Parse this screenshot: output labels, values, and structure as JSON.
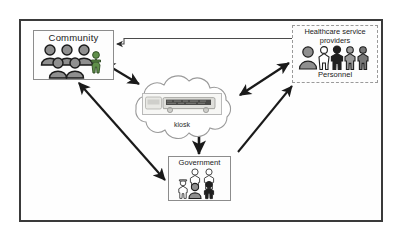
{
  "diagram": {
    "frame_label": "diagram-frame",
    "colors": {
      "frame_border": "#3a3a3a",
      "box_border": "#8c8c8c",
      "dashed_border": "#9a9a9a",
      "arrow_dark": "#1a1a1a",
      "arrow_thin": "#4a4a4a",
      "person_gray": "#8f8f8f",
      "person_dark": "#1f1f1f",
      "person_green": "#5f8f4a",
      "background": "#ffffff"
    }
  },
  "nodes": {
    "community": {
      "label": "Community",
      "icon": "group-of-people-icon",
      "people_count": 6
    },
    "healthcare": {
      "label": "Healthcare service providers",
      "label_line1": "Healthcare service",
      "label_line2": "providers",
      "sublabel": "Personnel",
      "icon": "healthcare-personnel-icon",
      "people_count": 5
    },
    "government": {
      "label": "Government",
      "icon": "government-officials-icon",
      "people_count": 5
    },
    "kiosk": {
      "label": "kiosk",
      "icon": "kiosk-device-icon",
      "shape": "cloud"
    }
  },
  "connections": [
    {
      "name": "community-healthcare",
      "from": "community",
      "to": "healthcare",
      "style": "thin-elbow",
      "direction": "bidirectional"
    },
    {
      "name": "community-kiosk",
      "from": "community",
      "to": "kiosk",
      "style": "thick",
      "direction": "bidirectional"
    },
    {
      "name": "kiosk-healthcare",
      "from": "kiosk",
      "to": "healthcare",
      "style": "thick",
      "direction": "bidirectional"
    },
    {
      "name": "kiosk-government",
      "from": "kiosk",
      "to": "government",
      "style": "thick",
      "direction": "down"
    },
    {
      "name": "community-government",
      "from": "community",
      "to": "government",
      "style": "thick",
      "direction": "bidirectional"
    },
    {
      "name": "government-healthcare",
      "from": "government",
      "to": "healthcare",
      "style": "thick",
      "direction": "up"
    }
  ]
}
